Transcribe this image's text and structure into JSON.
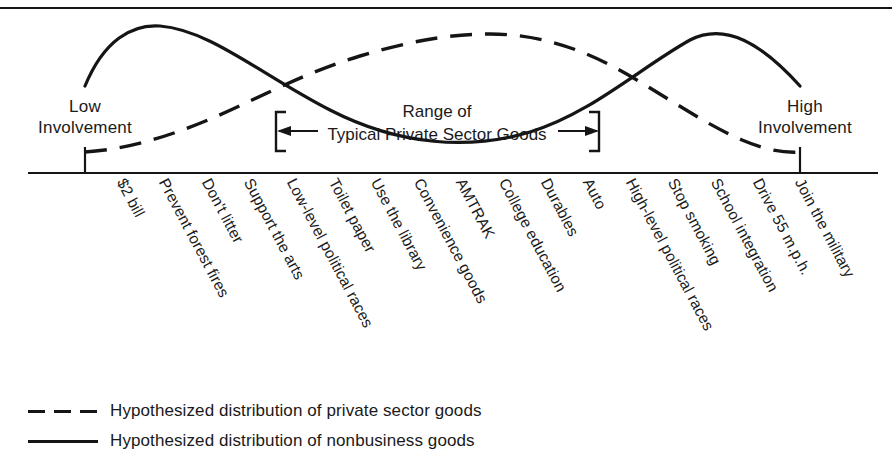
{
  "figure": {
    "axis": {
      "left_label": {
        "line1": "Low",
        "line2": "Involvement"
      },
      "right_label": {
        "line1": "High",
        "line2": "Involvement"
      }
    },
    "annotation": {
      "line1": "Range of",
      "line2": "Typical Private Sector Goods"
    },
    "legend": [
      {
        "style": "dashed",
        "label": "Hypothesized distribution of private sector goods"
      },
      {
        "style": "solid",
        "label": "Hypothesized distribution of nonbusiness goods"
      }
    ]
  },
  "chart_data": {
    "type": "line",
    "title": "",
    "xlabel": "",
    "ylabel": "",
    "grid": false,
    "legend_position": "below",
    "axis_endpoints": [
      "Low Involvement",
      "High Involvement"
    ],
    "annotations": [
      {
        "text": "Range of Typical Private Sector Goods",
        "type": "bracketed-range",
        "start_category": "Use the library",
        "end_category": "Auto"
      }
    ],
    "categories": [
      "$2 bill",
      "Prevent forest fires",
      "Don't litter",
      "Support the arts",
      "Low-level political races",
      "Toilet paper",
      "Use the library",
      "Convenience goods",
      "AMTRAK",
      "College education",
      "Durables",
      "Auto",
      "High-level political races",
      "Stop smoking",
      "School integration",
      "Drive 55 m.p.h.",
      "Join the military"
    ],
    "series": [
      {
        "name": "Hypothesized distribution of nonbusiness goods",
        "style": "solid",
        "values": [
          62,
          94,
          100,
          96,
          86,
          72,
          58,
          44,
          36,
          36,
          44,
          60,
          76,
          88,
          92,
          84,
          62
        ]
      },
      {
        "name": "Hypothesized distribution of private sector goods",
        "style": "dashed",
        "values": [
          12,
          18,
          30,
          46,
          62,
          78,
          90,
          97,
          99,
          96,
          88,
          74,
          58,
          42,
          28,
          18,
          12
        ]
      }
    ],
    "colors": {
      "ink": "#151515",
      "background": "#ffffff"
    }
  }
}
